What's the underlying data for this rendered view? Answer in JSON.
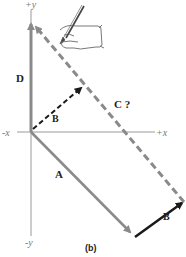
{
  "figure": {
    "caption": "(b)",
    "axes": {
      "plus_y": "+y",
      "minus_y": "-y",
      "minus_x": "-x",
      "plus_x": "+x"
    },
    "vectors": [
      {
        "id": "D",
        "label": "D",
        "style": "solid",
        "color": "#8a8a8a"
      },
      {
        "id": "A",
        "label": "A",
        "style": "solid",
        "color": "#8a8a8a"
      },
      {
        "id": "B_tail",
        "label": "B",
        "style": "solid",
        "color": "#1a1a1a"
      },
      {
        "id": "B_origin",
        "label": "B",
        "style": "dashed",
        "color": "#1a1a1a"
      },
      {
        "id": "C",
        "label": "C ?",
        "style": "dashed",
        "color": "#8a8a8a"
      }
    ],
    "illustration": "hand-drawing-pencil"
  }
}
